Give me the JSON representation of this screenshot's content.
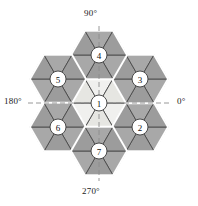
{
  "figure": {
    "background_color": "#ffffff",
    "colors": {
      "outer_triangle_fill": "#a8a8a8",
      "outer_triangle_fill_alt": "#9c9c9c",
      "inner_triangle_fill": "#f0f0ee",
      "inner_triangle_fill_alt": "#e6e6e2",
      "triangle_edge": "#4a4a4a",
      "hexagon_edge": "#ffffff",
      "node_circle_fill": "#ffffff",
      "node_circle_stroke": "#3a3a3a",
      "node_text": "#111111",
      "axis_line": "#8c8c8c",
      "label_text": "#1a1a1a"
    }
  },
  "axes": {
    "angle_labels": [
      {
        "id": "angle-90",
        "text": "90°"
      },
      {
        "id": "angle-0",
        "text": "0°"
      },
      {
        "id": "angle-270",
        "text": "270°"
      },
      {
        "id": "angle-180",
        "text": "180°"
      }
    ]
  },
  "nodes": [
    {
      "id": 1,
      "label": "1",
      "cx": 99,
      "cy": 103,
      "position": "center"
    },
    {
      "id": 2,
      "label": "2",
      "cx": 140,
      "cy": 127,
      "position": "lower-right"
    },
    {
      "id": 3,
      "label": "3",
      "cx": 140,
      "cy": 79,
      "position": "upper-right"
    },
    {
      "id": 4,
      "label": "4",
      "cx": 99,
      "cy": 55,
      "position": "top"
    },
    {
      "id": 5,
      "label": "5",
      "cx": 58,
      "cy": 79,
      "position": "upper-left"
    },
    {
      "id": 6,
      "label": "6",
      "cx": 58,
      "cy": 127,
      "position": "lower-left"
    },
    {
      "id": 7,
      "label": "7",
      "cx": 99,
      "cy": 151,
      "position": "bottom"
    }
  ]
}
